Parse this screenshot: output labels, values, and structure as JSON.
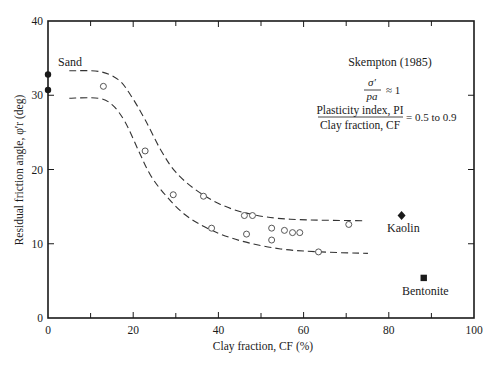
{
  "chart_data": {
    "type": "scatter",
    "title": "",
    "xlabel": "Clay fraction, CF (%)",
    "ylabel": "Residual friction angle, φ′r (deg)",
    "xlim": [
      0,
      100
    ],
    "ylim": [
      0,
      40
    ],
    "xticks": [
      0,
      20,
      40,
      60,
      80,
      100
    ],
    "yticks": [
      0,
      10,
      20,
      30,
      40
    ],
    "grid": false,
    "series": [
      {
        "name": "Sand",
        "marker": "filled-circle",
        "points": [
          [
            0,
            32.8
          ],
          [
            0,
            30.7
          ]
        ]
      },
      {
        "name": "Test data",
        "marker": "open-circle",
        "points": [
          [
            13.0,
            31.2
          ],
          [
            22.8,
            22.5
          ],
          [
            29.4,
            16.6
          ],
          [
            36.5,
            16.4
          ],
          [
            38.4,
            12.1
          ],
          [
            46.1,
            13.8
          ],
          [
            48.0,
            13.8
          ],
          [
            46.6,
            11.3
          ],
          [
            52.5,
            12.1
          ],
          [
            52.5,
            10.5
          ],
          [
            55.5,
            11.8
          ],
          [
            57.4,
            11.5
          ],
          [
            59.1,
            11.5
          ],
          [
            63.5,
            8.9
          ],
          [
            70.6,
            12.6
          ]
        ]
      },
      {
        "name": "Kaolin",
        "marker": "filled-diamond",
        "points": [
          [
            83.0,
            13.8
          ]
        ]
      },
      {
        "name": "Bentonite",
        "marker": "filled-square",
        "points": [
          [
            88.2,
            5.4
          ]
        ]
      },
      {
        "name": "Upper bound",
        "style": "dashed-line",
        "points": [
          [
            5,
            33.3
          ],
          [
            12,
            33.2
          ],
          [
            16.5,
            32.1
          ],
          [
            19.3,
            30.1
          ],
          [
            22.8,
            26.7
          ],
          [
            26.4,
            22.7
          ],
          [
            29.9,
            19.7
          ],
          [
            34.6,
            17.3
          ],
          [
            40.5,
            15.3
          ],
          [
            47.5,
            14.0
          ],
          [
            56.9,
            13.3
          ],
          [
            74.4,
            13.1
          ]
        ]
      },
      {
        "name": "Lower bound",
        "style": "dashed-line",
        "points": [
          [
            5,
            29.6
          ],
          [
            11.8,
            29.6
          ],
          [
            15.1,
            28.7
          ],
          [
            18.1,
            26.4
          ],
          [
            21.2,
            22.6
          ],
          [
            24.0,
            19.3
          ],
          [
            27.5,
            16.6
          ],
          [
            32.2,
            13.9
          ],
          [
            38.1,
            11.9
          ],
          [
            45.2,
            10.4
          ],
          [
            54.6,
            9.3
          ],
          [
            64.0,
            8.9
          ],
          [
            75.1,
            8.7
          ]
        ]
      }
    ],
    "annotations": {
      "sand_label": "Sand",
      "kaolin_label": "Kaolin",
      "bentonite_label": "Bentonite",
      "source": "Skempton (1985)",
      "ratio_num": "σ′",
      "ratio_den": "pa",
      "ratio_value": "≈ 1",
      "pi_num": "Plasticity index, PI",
      "pi_den": "Clay fraction, CF",
      "pi_value": "= 0.5 to 0.9"
    }
  }
}
